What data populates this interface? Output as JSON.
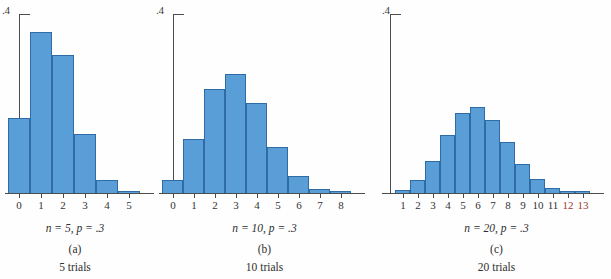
{
  "figure": {
    "background": "#fefefe",
    "bar_fill": "#5a9ed8",
    "bar_stroke": "#2f6ca6",
    "axis_color": "#4c4c4c",
    "accent_label_color": "#9c3b34"
  },
  "panels": [
    {
      "id": "a",
      "y_axis_label": ".4",
      "caption_params": "n = 5, p = .3",
      "caption_letter": "(a)",
      "caption_trials": "5 trials",
      "chart_data": {
        "type": "bar",
        "title": "",
        "subtitle": "n = 5, p = .3",
        "xlabel": "",
        "ylabel": "",
        "ylim": [
          0,
          0.4
        ],
        "ytick_labels": [
          ".4"
        ],
        "ytick_values": [
          0.4
        ],
        "grid": false,
        "legend": "none",
        "categories": [
          "0",
          "1",
          "2",
          "3",
          "4",
          "5"
        ],
        "values": [
          0.168,
          0.36,
          0.309,
          0.132,
          0.028,
          0.002
        ]
      }
    },
    {
      "id": "b",
      "y_axis_label": ".4",
      "caption_params": "n = 10, p = .3",
      "caption_letter": "(b)",
      "caption_trials": "10 trials",
      "chart_data": {
        "type": "bar",
        "title": "",
        "subtitle": "n = 10, p = .3",
        "xlabel": "",
        "ylabel": "",
        "ylim": [
          0,
          0.4
        ],
        "ytick_labels": [
          ".4"
        ],
        "ytick_values": [
          0.4
        ],
        "grid": false,
        "legend": "none",
        "categories": [
          "0",
          "1",
          "2",
          "3",
          "4",
          "5",
          "6",
          "7",
          "8"
        ],
        "values": [
          0.028,
          0.121,
          0.233,
          0.267,
          0.2,
          0.103,
          0.037,
          0.009,
          0.001
        ]
      }
    },
    {
      "id": "c",
      "y_axis_label": ".4",
      "caption_params": "n = 20, p = .3",
      "caption_letter": "(c)",
      "caption_trials": "20 trials",
      "chart_data": {
        "type": "bar",
        "title": "",
        "subtitle": "n = 20, p = .3",
        "xlabel": "",
        "ylabel": "",
        "ylim": [
          0,
          0.4
        ],
        "ytick_labels": [
          ".4"
        ],
        "ytick_values": [
          0.4
        ],
        "grid": false,
        "legend": "none",
        "categories": [
          "1",
          "2",
          "3",
          "4",
          "5",
          "6",
          "7",
          "8",
          "9",
          "10",
          "11",
          "12",
          "13"
        ],
        "accent_categories": [
          "12",
          "13"
        ],
        "values": [
          0.007,
          0.028,
          0.072,
          0.13,
          0.179,
          0.192,
          0.164,
          0.114,
          0.065,
          0.031,
          0.012,
          0.004,
          0.001
        ]
      }
    }
  ]
}
